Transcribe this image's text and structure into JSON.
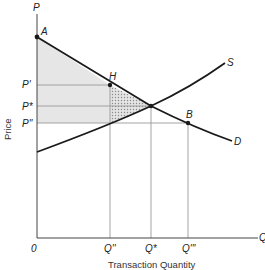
{
  "diagram": {
    "type": "supply-demand",
    "axes": {
      "y_axis_symbol": "P",
      "x_axis_symbol": "Q",
      "y_axis_title": "Price",
      "x_axis_title": "Transaction Quantity",
      "origin_label": "0"
    },
    "curves": {
      "demand_label": "D",
      "supply_label": "S"
    },
    "points": {
      "a_label": "A",
      "h_label": "H",
      "b_label": "B"
    },
    "price_levels": {
      "p_prime": "P'",
      "p_star": "P*",
      "p_double_prime": "P''"
    },
    "quantity_levels": {
      "q_double_prime": "Q''",
      "q_star": "Q*",
      "q_triple_prime": "Q'''"
    },
    "colors": {
      "curve": "#1a1a1a",
      "guide_line": "#9a9a9a",
      "shaded_region": "#e4e4e4",
      "hatched_region": "#b5b5b5"
    }
  }
}
